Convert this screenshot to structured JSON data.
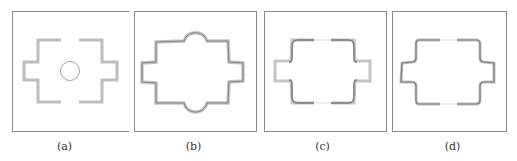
{
  "figure": {
    "panels": [
      {
        "id": "a",
        "label": "(a)",
        "description": "Initial design: four L-shaped bracket segments forming a cross outline with a small circle in the center"
      },
      {
        "id": "b",
        "label": "(b)",
        "description": "Evolved closed cross-shaped boundary with rounded bulges at top and bottom"
      },
      {
        "id": "c",
        "label": "(c)",
        "description": "Rounded rectangle with small rectangular side tabs, gaps at top and bottom centers"
      },
      {
        "id": "d",
        "label": "(d)",
        "description": "Rounded cross outline with short side arms, gaps at top and bottom centers"
      }
    ],
    "colors": {
      "frame": "#8a8a8a",
      "thick_stroke": "#b8b8b8",
      "dark_stroke": "#7a7a7a",
      "thin_stroke": "#9a9a9a"
    }
  }
}
